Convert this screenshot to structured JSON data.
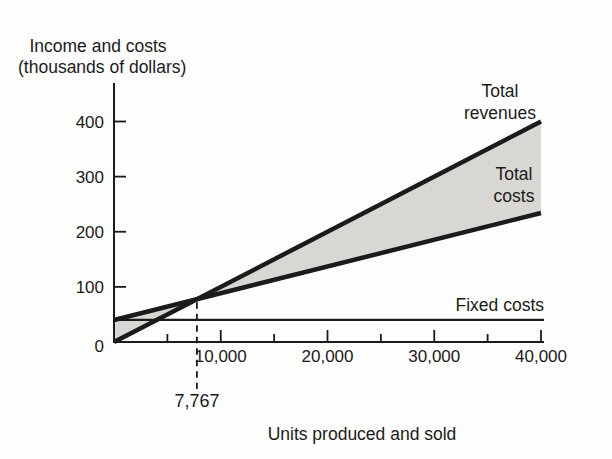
{
  "figure": {
    "background": "#fdfdfb",
    "ink": "#1b1b1b"
  },
  "chart_data": {
    "type": "line",
    "title": "Income and costs (thousands of dollars)",
    "title_lines": [
      "Income and costs",
      "(thousands of dollars)"
    ],
    "xlabel": "Units produced and sold",
    "ylabel": "Income and costs (thousands of dollars)",
    "xlim": [
      0,
      40000
    ],
    "ylim": [
      0,
      400
    ],
    "grid": false,
    "y_ticks": [
      0,
      100,
      200,
      300,
      400
    ],
    "y_tick_labels": [
      "0",
      "100",
      "200",
      "300",
      "400"
    ],
    "x_major_ticks": [
      10000,
      20000,
      30000,
      40000
    ],
    "x_major_tick_labels": [
      "10,000",
      "20,000",
      "30,000",
      "40,000"
    ],
    "x_minor_ticks": [
      5000,
      15000,
      25000,
      35000
    ],
    "series": [
      {
        "name": "Total revenues",
        "points": [
          [
            0,
            0
          ],
          [
            40000,
            400
          ]
        ],
        "style": "thick"
      },
      {
        "name": "Total costs",
        "points": [
          [
            0,
            40
          ],
          [
            40000,
            234
          ]
        ],
        "style": "thick"
      },
      {
        "name": "Fixed costs",
        "points": [
          [
            0,
            40
          ],
          [
            40000,
            40
          ]
        ],
        "style": "thin"
      }
    ],
    "shading": {
      "description": "region between Total revenues line and Total costs line (loss wedge left of break-even, profit wedge right of break-even)",
      "color": "#d8d7d3"
    },
    "break_even": {
      "units": 7767,
      "label": "7,767",
      "value_thousands": 77.67
    },
    "annotations": {
      "total_revenues_lines": [
        "Total",
        "revenues"
      ],
      "total_costs_lines": [
        "Total",
        "costs"
      ],
      "fixed_costs_label": "Fixed costs"
    }
  }
}
